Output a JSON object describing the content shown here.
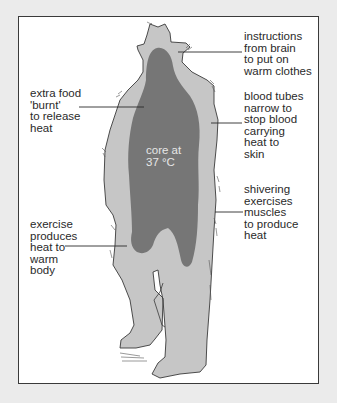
{
  "diagram": {
    "core_label": "core at\n37 °C",
    "colors": {
      "background": "#ebebeb",
      "panel": "#ffffff",
      "body_outer": "#c6c6c6",
      "body_core": "#767676",
      "line": "#2a2a2a"
    },
    "labels": [
      {
        "id": "instructions",
        "text": "instructions\nfrom brain\nto put on\nwarm clothes"
      },
      {
        "id": "extra-food",
        "text": "extra food\n'burnt'\nto release\nheat"
      },
      {
        "id": "blood-tubes",
        "text": "blood tubes\nnarrow to\nstop blood\ncarrying\nheat to\nskin"
      },
      {
        "id": "shivering",
        "text": "shivering\nexercises\nmuscles\nto produce\nheat"
      },
      {
        "id": "exercise",
        "text": "exercise\nproduces\nheat to\nwarm\nbody"
      }
    ]
  }
}
